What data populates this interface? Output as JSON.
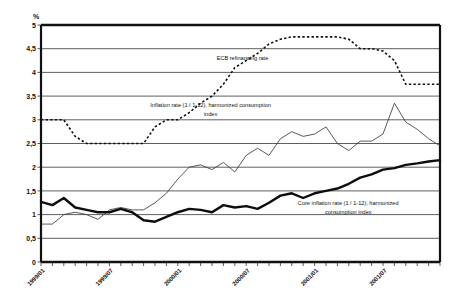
{
  "chart_data": {
    "type": "line",
    "title": "",
    "xlabel": "",
    "ylabel": "%",
    "ylim": [
      0,
      5
    ],
    "ytick_labels": [
      "5",
      "4,5",
      "4",
      "3,5",
      "3",
      "2,5",
      "2",
      "1,5",
      "1",
      "0,5",
      "0"
    ],
    "ytick_values": [
      5,
      4.5,
      4,
      3.5,
      3,
      2.5,
      2,
      1.5,
      1,
      0.5,
      0
    ],
    "grid": true,
    "legend_position": "inline-annotations",
    "x": [
      "1999/01",
      "1999/02",
      "1999/03",
      "1999/04",
      "1999/05",
      "1999/06",
      "1999/07",
      "1999/08",
      "1999/09",
      "1999/10",
      "1999/11",
      "1999/12",
      "2000/01",
      "2000/02",
      "2000/03",
      "2000/04",
      "2000/05",
      "2000/06",
      "2000/07",
      "2000/08",
      "2000/09",
      "2000/10",
      "2000/11",
      "2000/12",
      "2001/01",
      "2001/02",
      "2001/03",
      "2001/04",
      "2001/05",
      "2001/06",
      "2001/07",
      "2001/08",
      "2001/09",
      "2001/10",
      "2001/11",
      "2001/12"
    ],
    "xtick_labels": [
      "1999/01",
      "1999/07",
      "2000/01",
      "2000/07",
      "2001/01",
      "2001/07"
    ],
    "xtick_indices": [
      0,
      6,
      12,
      18,
      24,
      30
    ],
    "series": [
      {
        "name": "ECB refinancing rate",
        "style": "dashed",
        "values": [
          3.0,
          3.0,
          3.0,
          2.65,
          2.5,
          2.5,
          2.5,
          2.5,
          2.5,
          2.5,
          2.85,
          3.0,
          3.0,
          3.15,
          3.35,
          3.5,
          3.75,
          4.1,
          4.25,
          4.4,
          4.6,
          4.7,
          4.75,
          4.75,
          4.75,
          4.75,
          4.75,
          4.7,
          4.5,
          4.5,
          4.45,
          4.25,
          3.75,
          3.75,
          3.75,
          3.75
        ]
      },
      {
        "name": "Inflation rate (1 / 1-12), harmonized consumption index",
        "style": "thin",
        "values": [
          0.8,
          0.8,
          1.0,
          1.05,
          1.0,
          0.9,
          1.1,
          1.15,
          1.1,
          1.1,
          1.25,
          1.45,
          1.75,
          2.0,
          2.05,
          1.95,
          2.1,
          1.9,
          2.25,
          2.4,
          2.25,
          2.6,
          2.75,
          2.65,
          2.7,
          2.85,
          2.5,
          2.35,
          2.55,
          2.55,
          2.7,
          3.35,
          2.95,
          2.8,
          2.6,
          2.45
        ]
      },
      {
        "name": "Core inflation rate (1 / 1-12), harmonized consumption index",
        "style": "thick",
        "values": [
          1.27,
          1.2,
          1.35,
          1.15,
          1.1,
          1.05,
          1.05,
          1.12,
          1.05,
          0.88,
          0.85,
          0.95,
          1.05,
          1.12,
          1.1,
          1.05,
          1.2,
          1.15,
          1.18,
          1.12,
          1.25,
          1.4,
          1.45,
          1.35,
          1.45,
          1.5,
          1.55,
          1.65,
          1.78,
          1.85,
          1.95,
          1.98,
          2.05,
          2.08,
          2.12,
          2.15
        ]
      }
    ],
    "annotations": [
      {
        "name": "ecb-refinancing-rate-label",
        "text": "ECB refinancing rate",
        "x_frac": 0.505,
        "y_value": 4.26
      },
      {
        "name": "inflation-rate-label-line1",
        "text": "Inflation rate (1 / 1-12), harmonized consumption",
        "x_frac": 0.425,
        "y_value": 3.27
      },
      {
        "name": "inflation-rate-label-line2",
        "text": "index",
        "x_frac": 0.425,
        "y_value": 3.07
      },
      {
        "name": "core-inflation-rate-label-line1",
        "text": "Core inflation rate (1 / 1-12), harmonized",
        "x_frac": 0.77,
        "y_value": 1.21
      },
      {
        "name": "core-inflation-rate-label-line2",
        "text": "consumption index",
        "x_frac": 0.77,
        "y_value": 1.02
      }
    ]
  }
}
